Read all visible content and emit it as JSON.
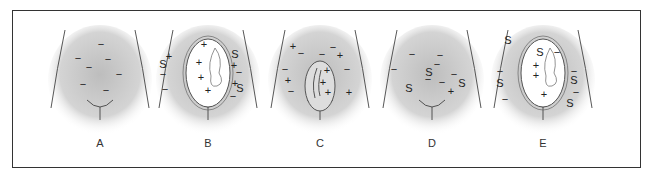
{
  "figure": {
    "panels": [
      {
        "id": "A",
        "label": "A",
        "fetus": "none",
        "marks": [
          [
            "−",
            56,
            20
          ],
          [
            "−",
            33,
            34
          ],
          [
            "−",
            63,
            35
          ],
          [
            "−",
            44,
            43
          ],
          [
            "−",
            74,
            50
          ],
          [
            "−",
            38,
            60
          ],
          [
            "−",
            61,
            66
          ]
        ]
      },
      {
        "id": "B",
        "label": "B",
        "fetus": "full",
        "marks": [
          [
            "+",
            51,
            20
          ],
          [
            "+",
            46,
            38
          ],
          [
            "+",
            48,
            53
          ],
          [
            "+",
            55,
            66
          ],
          [
            "S",
            10,
            40
          ],
          [
            "+",
            16,
            32
          ],
          [
            "−",
            10,
            50
          ],
          [
            "−",
            12,
            65
          ],
          [
            "S",
            82,
            30
          ],
          [
            "+",
            81,
            41
          ],
          [
            "−",
            86,
            48
          ],
          [
            "+",
            82,
            59
          ],
          [
            "S",
            87,
            64
          ],
          [
            "−",
            80,
            72
          ]
        ]
      },
      {
        "id": "C",
        "label": "C",
        "fetus": "small",
        "marks": [
          [
            "+",
            28,
            22
          ],
          [
            "−",
            36,
            29
          ],
          [
            "−",
            68,
            23
          ],
          [
            "−",
            57,
            30
          ],
          [
            "+",
            75,
            31
          ],
          [
            "−",
            82,
            45
          ],
          [
            "−",
            20,
            45
          ],
          [
            "+",
            23,
            56
          ],
          [
            "−",
            26,
            67
          ],
          [
            "+",
            62,
            46
          ],
          [
            "+",
            58,
            58
          ],
          [
            "+",
            63,
            68
          ],
          [
            "+",
            84,
            68
          ]
        ]
      },
      {
        "id": "D",
        "label": "D",
        "fetus": "none",
        "marks": [
          [
            "−",
            35,
            30
          ],
          [
            "−",
            63,
            31
          ],
          [
            "−",
            60,
            40
          ],
          [
            "−",
            17,
            45
          ],
          [
            "S",
            52,
            48
          ],
          [
            "−",
            51,
            55
          ],
          [
            "−",
            77,
            50
          ],
          [
            "S",
            32,
            64
          ],
          [
            "S",
            85,
            59
          ],
          [
            "−",
            65,
            58
          ],
          [
            "+",
            74,
            67
          ]
        ]
      },
      {
        "id": "E",
        "label": "E",
        "fetus": "full",
        "marks": [
          [
            "S",
            20,
            16
          ],
          [
            "S",
            52,
            28
          ],
          [
            "+",
            48,
            41
          ],
          [
            "+",
            48,
            51
          ],
          [
            "+",
            56,
            70
          ],
          [
            "−",
            12,
            47
          ],
          [
            "S",
            12,
            59
          ],
          [
            "−",
            17,
            75
          ],
          [
            "−",
            69,
            28
          ],
          [
            "S",
            86,
            56
          ],
          [
            "−",
            86,
            47
          ],
          [
            "−",
            88,
            68
          ],
          [
            "S",
            82,
            79
          ]
        ]
      }
    ]
  }
}
